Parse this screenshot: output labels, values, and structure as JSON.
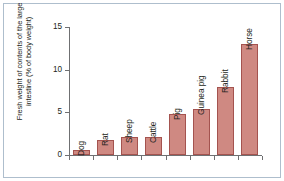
{
  "figure": {
    "frame_color": "#aebecd",
    "bar_fill": "#cf8982",
    "bar_stroke": "#a4534f",
    "axis_color": "#6f7072",
    "text_color": "#231f20"
  },
  "chart_data": {
    "type": "bar",
    "title": "",
    "xlabel": "",
    "ylabel": "Fresh weight of contents of the large\nintestine (% of body weight)",
    "ylim": [
      0,
      15
    ],
    "yticks": [
      0,
      5,
      10,
      15
    ],
    "ytick_labels": [
      "0",
      "5",
      "10",
      "15"
    ],
    "grid": false,
    "legend": null,
    "categories": [
      "Dog",
      "Rat",
      "Sheep",
      "Cattle",
      "Pig",
      "Guinea pig",
      "Rabbit",
      "Horse"
    ],
    "values": [
      0.6,
      1.8,
      2.1,
      2.1,
      4.8,
      5.4,
      8.0,
      13.0
    ],
    "bars": [
      {
        "label": "Dog",
        "value": 0.6
      },
      {
        "label": "Rat",
        "value": 1.8
      },
      {
        "label": "Sheep",
        "value": 2.1
      },
      {
        "label": "Cattle",
        "value": 2.1
      },
      {
        "label": "Pig",
        "value": 4.8
      },
      {
        "label": "Guinea pig",
        "value": 5.4
      },
      {
        "label": "Rabbit",
        "value": 8.0
      },
      {
        "label": "Horse",
        "value": 13.0
      }
    ]
  }
}
